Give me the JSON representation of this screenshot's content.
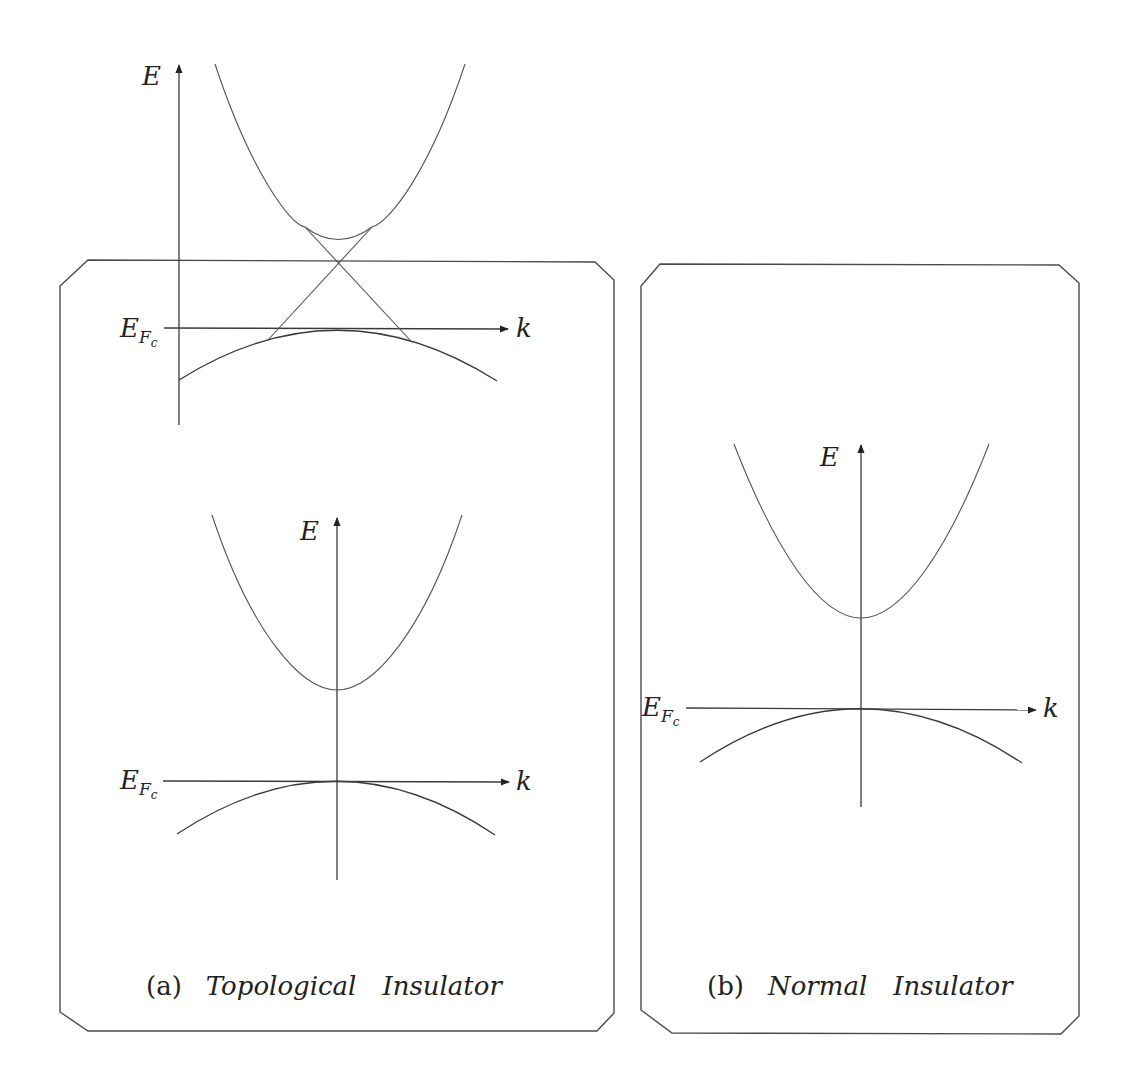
{
  "figure": {
    "panels": [
      {
        "id": "a",
        "caption_index": "(a)",
        "caption_word1": "Topological",
        "caption_word2": "Insulator",
        "diagrams": [
          {
            "name": "surface-state-dirac-cone",
            "y_label": "E",
            "x_label": "k",
            "fermi_label": "E",
            "fermi_sub": "F",
            "fermi_subsub": "c",
            "features": [
              "conduction band parabola",
              "valence band inverted parabola",
              "linear Dirac cone crossing above E_F"
            ]
          },
          {
            "name": "bulk-band-gap",
            "y_label": "E",
            "x_label": "k",
            "fermi_label": "E",
            "fermi_sub": "F",
            "fermi_subsub": "c",
            "features": [
              "conduction band parabola",
              "valence band inverted parabola touching E_F"
            ]
          }
        ]
      },
      {
        "id": "b",
        "caption_index": "(b)",
        "caption_word1": "Normal",
        "caption_word2": "Insulator",
        "diagrams": [
          {
            "name": "normal-band-gap",
            "y_label": "E",
            "x_label": "k",
            "fermi_label": "E",
            "fermi_sub": "F",
            "fermi_subsub": "c",
            "features": [
              "conduction band parabola",
              "valence band inverted parabola touching E_F"
            ]
          }
        ]
      }
    ],
    "colors": {
      "line": "#3a3a3a",
      "frame": "#4a4a4a",
      "background": "#ffffff"
    }
  }
}
